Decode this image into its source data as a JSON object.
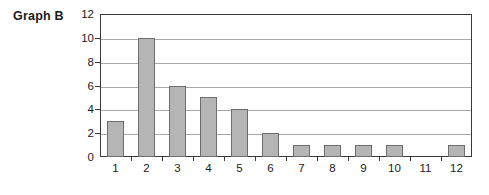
{
  "chart_data": {
    "type": "bar",
    "title": "Graph B",
    "xlabel": "",
    "ylabel": "",
    "categories": [
      "1",
      "2",
      "3",
      "4",
      "5",
      "6",
      "7",
      "8",
      "9",
      "10",
      "11",
      "12"
    ],
    "values": [
      3,
      10,
      6,
      5,
      4,
      2,
      1,
      1,
      1,
      1,
      0,
      1
    ],
    "ylim": [
      0,
      12
    ],
    "y_ticks": [
      0,
      2,
      4,
      6,
      8,
      10,
      12
    ],
    "y_tick_labels": [
      "0",
      "2",
      "4",
      "6",
      "8",
      "10",
      "12"
    ],
    "grid": "horizontal",
    "legend": null,
    "bar_color": "#b5b5b5",
    "bar_border_color": "#6d6d6d",
    "gridline_color": "#a8a8a8",
    "axis_color": "#3a3a3a",
    "text_color": "#1a1a1a"
  }
}
